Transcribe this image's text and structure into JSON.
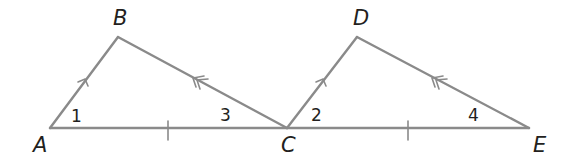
{
  "diagram": {
    "type": "geometry",
    "vertices": {
      "A": {
        "label": "A",
        "x": 50,
        "y": 128
      },
      "B": {
        "label": "B",
        "x": 118,
        "y": 37
      },
      "C": {
        "label": "C",
        "x": 287,
        "y": 128
      },
      "D": {
        "label": "D",
        "x": 357,
        "y": 37
      },
      "E": {
        "label": "E",
        "x": 529,
        "y": 128
      }
    },
    "segments": [
      {
        "from": "A",
        "to": "B",
        "mark": "single-arrow"
      },
      {
        "from": "B",
        "to": "C",
        "mark": "double-arrow"
      },
      {
        "from": "A",
        "to": "C",
        "mark": "single-tick"
      },
      {
        "from": "C",
        "to": "D",
        "mark": "single-arrow"
      },
      {
        "from": "D",
        "to": "E",
        "mark": "double-arrow"
      },
      {
        "from": "C",
        "to": "E",
        "mark": "single-tick"
      }
    ],
    "angles": [
      {
        "label": "1",
        "vertex": "A"
      },
      {
        "label": "2",
        "vertex": "C"
      },
      {
        "label": "3",
        "vertex": "C"
      },
      {
        "label": "4",
        "vertex": "E"
      }
    ],
    "colors": {
      "line": "#8a8a8a",
      "text": "#231f20"
    }
  }
}
